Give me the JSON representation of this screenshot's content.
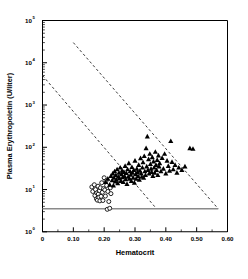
{
  "chart_data": {
    "type": "scatter",
    "title": "",
    "subtitle": "",
    "xlabel": "Hematocrit",
    "ylabel": "Plasma Erythropoietin (U/liter)",
    "xlim": [
      0,
      0.6
    ],
    "ylim": [
      1,
      100000
    ],
    "yscale": "log",
    "xscale": "linear",
    "grid": false,
    "legend_position": "none",
    "xticks": [
      0,
      0.1,
      0.2,
      0.3,
      0.4,
      0.5,
      0.6
    ],
    "xtick_labels": [
      "0",
      "0.10",
      "0.20",
      "0.30",
      "0.40",
      "0.50",
      "0.60"
    ],
    "xminor_ticks": [
      0.05,
      0.15,
      0.25,
      0.35,
      0.45,
      0.55
    ],
    "yticks": [
      1,
      10,
      100,
      1000,
      10000,
      100000
    ],
    "ytick_labels": [
      "10",
      "10",
      "10",
      "10",
      "10",
      "10"
    ],
    "ytick_exponents": [
      "0",
      "1",
      "2",
      "3",
      "4",
      "5"
    ],
    "series": [
      {
        "name": "open-circles",
        "marker": "circle-open",
        "color": "#000000",
        "fill": "#ffffff",
        "points": [
          [
            0.16,
            11.5
          ],
          [
            0.163,
            9.0
          ],
          [
            0.168,
            13.0
          ],
          [
            0.17,
            7.2
          ],
          [
            0.172,
            10.0
          ],
          [
            0.175,
            6.0
          ],
          [
            0.176,
            8.3
          ],
          [
            0.178,
            5.6
          ],
          [
            0.18,
            12.0
          ],
          [
            0.181,
            7.8
          ],
          [
            0.183,
            6.6
          ],
          [
            0.185,
            9.4
          ],
          [
            0.186,
            5.4
          ],
          [
            0.188,
            11.0
          ],
          [
            0.19,
            6.9
          ],
          [
            0.192,
            14.5
          ],
          [
            0.194,
            8.6
          ],
          [
            0.196,
            5.5
          ],
          [
            0.198,
            10.5
          ],
          [
            0.2,
            19.0
          ],
          [
            0.202,
            9.8
          ],
          [
            0.204,
            7.0
          ],
          [
            0.206,
            16.0
          ],
          [
            0.208,
            12.5
          ],
          [
            0.21,
            3.4
          ],
          [
            0.212,
            9.0
          ],
          [
            0.215,
            5.2
          ],
          [
            0.218,
            3.6
          ],
          [
            0.22,
            11.0
          ],
          [
            0.222,
            8.0
          ]
        ]
      },
      {
        "name": "filled-triangles",
        "marker": "triangle-filled",
        "color": "#000000",
        "fill": "#000000",
        "points": [
          [
            0.205,
            15.0
          ],
          [
            0.212,
            18.0
          ],
          [
            0.218,
            13.0
          ],
          [
            0.222,
            21.0
          ],
          [
            0.226,
            16.5
          ],
          [
            0.228,
            24.0
          ],
          [
            0.23,
            12.5
          ],
          [
            0.232,
            19.0
          ],
          [
            0.234,
            27.0
          ],
          [
            0.236,
            15.5
          ],
          [
            0.238,
            22.0
          ],
          [
            0.24,
            17.0
          ],
          [
            0.242,
            30.0
          ],
          [
            0.244,
            14.0
          ],
          [
            0.246,
            20.0
          ],
          [
            0.248,
            25.0
          ],
          [
            0.25,
            18.5
          ],
          [
            0.252,
            33.0
          ],
          [
            0.254,
            16.0
          ],
          [
            0.256,
            23.0
          ],
          [
            0.258,
            28.0
          ],
          [
            0.26,
            19.5
          ],
          [
            0.262,
            15.0
          ],
          [
            0.264,
            26.0
          ],
          [
            0.266,
            21.0
          ],
          [
            0.268,
            36.0
          ],
          [
            0.27,
            17.5
          ],
          [
            0.272,
            24.5
          ],
          [
            0.274,
            13.5
          ],
          [
            0.276,
            30.0
          ],
          [
            0.278,
            20.0
          ],
          [
            0.28,
            42.0
          ],
          [
            0.282,
            18.0
          ],
          [
            0.284,
            27.0
          ],
          [
            0.286,
            22.5
          ],
          [
            0.288,
            16.0
          ],
          [
            0.29,
            34.0
          ],
          [
            0.292,
            25.0
          ],
          [
            0.294,
            19.0
          ],
          [
            0.296,
            29.0
          ],
          [
            0.298,
            14.5
          ],
          [
            0.3,
            48.0
          ],
          [
            0.302,
            23.0
          ],
          [
            0.304,
            18.0
          ],
          [
            0.306,
            31.0
          ],
          [
            0.308,
            26.0
          ],
          [
            0.31,
            21.0
          ],
          [
            0.312,
            38.0
          ],
          [
            0.314,
            17.0
          ],
          [
            0.316,
            28.0
          ],
          [
            0.318,
            55.0
          ],
          [
            0.32,
            24.0
          ],
          [
            0.322,
            20.0
          ],
          [
            0.324,
            33.0
          ],
          [
            0.326,
            44.0
          ],
          [
            0.328,
            19.0
          ],
          [
            0.33,
            62.0
          ],
          [
            0.332,
            27.0
          ],
          [
            0.334,
            22.0
          ],
          [
            0.336,
            95.0
          ],
          [
            0.338,
            35.0
          ],
          [
            0.34,
            180.0
          ],
          [
            0.342,
            29.0
          ],
          [
            0.344,
            52.0
          ],
          [
            0.346,
            24.0
          ],
          [
            0.348,
            70.0
          ],
          [
            0.35,
            40.0
          ],
          [
            0.352,
            31.0
          ],
          [
            0.354,
            26.0
          ],
          [
            0.356,
            58.0
          ],
          [
            0.358,
            21.0
          ],
          [
            0.36,
            46.0
          ],
          [
            0.362,
            33.0
          ],
          [
            0.364,
            25.0
          ],
          [
            0.366,
            78.0
          ],
          [
            0.368,
            38.0
          ],
          [
            0.37,
            29.0
          ],
          [
            0.372,
            50.0
          ],
          [
            0.374,
            22.0
          ],
          [
            0.376,
            64.0
          ],
          [
            0.378,
            35.0
          ],
          [
            0.38,
            42.0
          ],
          [
            0.384,
            27.0
          ],
          [
            0.388,
            56.0
          ],
          [
            0.392,
            31.0
          ],
          [
            0.396,
            70.0
          ],
          [
            0.4,
            24.0
          ],
          [
            0.404,
            48.0
          ],
          [
            0.408,
            36.0
          ],
          [
            0.412,
            28.0
          ],
          [
            0.416,
            140.0
          ],
          [
            0.42,
            45.0
          ],
          [
            0.424,
            30.0
          ],
          [
            0.43,
            38.0
          ],
          [
            0.436,
            25.0
          ],
          [
            0.442,
            33.0
          ],
          [
            0.452,
            29.0
          ],
          [
            0.462,
            35.0
          ],
          [
            0.478,
            95.0
          ],
          [
            0.488,
            92.0
          ]
        ]
      }
    ],
    "reference_lines": [
      {
        "name": "upper-dashed-reference",
        "style": "dashed",
        "x0": 0.1,
        "y0": 30000,
        "x1": 0.57,
        "y1": 3.5
      },
      {
        "name": "lower-dashed-reference",
        "style": "dashed",
        "x0": 0.0,
        "y0": 5000,
        "x1": 0.37,
        "y1": 3.5
      },
      {
        "name": "detection-limit-line",
        "style": "solid",
        "x0": 0.0,
        "y0": 3.5,
        "x1": 0.57,
        "y1": 3.5
      }
    ]
  }
}
